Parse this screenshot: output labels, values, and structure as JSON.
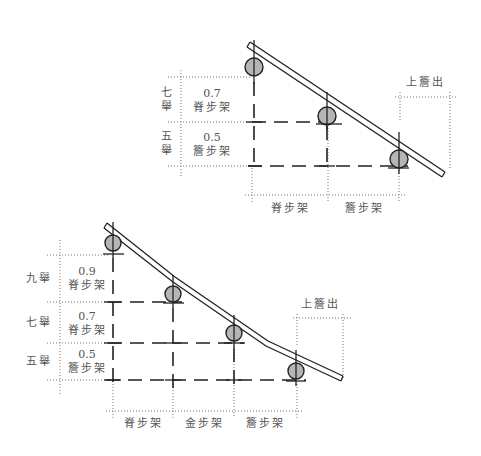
{
  "diagrams": [
    {
      "name": "five-purlin-roof-section",
      "level_labels": [
        "七舉",
        "五舉"
      ],
      "level_labels_vertical": [
        [
          "七",
          "舉"
        ],
        [
          "五",
          "舉"
        ]
      ],
      "segments": [
        {
          "ratio": "0.7",
          "step": "脊步架"
        },
        {
          "ratio": "0.5",
          "step": "簷步架"
        }
      ],
      "bottom_steps": [
        "脊步架",
        "簷步架"
      ],
      "overhang_label": "上簷出"
    },
    {
      "name": "seven-purlin-roof-section",
      "level_labels": [
        "九舉",
        "七舉",
        "五舉"
      ],
      "segments": [
        {
          "ratio": "0.9",
          "step": "脊步架"
        },
        {
          "ratio": "0.7",
          "step": "脊步架"
        },
        {
          "ratio": "0.5",
          "step": "簷步架"
        }
      ],
      "bottom_steps": [
        "脊步架",
        "金步架",
        "簷步架"
      ],
      "overhang_label": "上簷出"
    }
  ],
  "colors": {
    "purlin_fill": "#b5b5b5",
    "line": "#222222",
    "guide": "#777777",
    "text": "#555555"
  }
}
